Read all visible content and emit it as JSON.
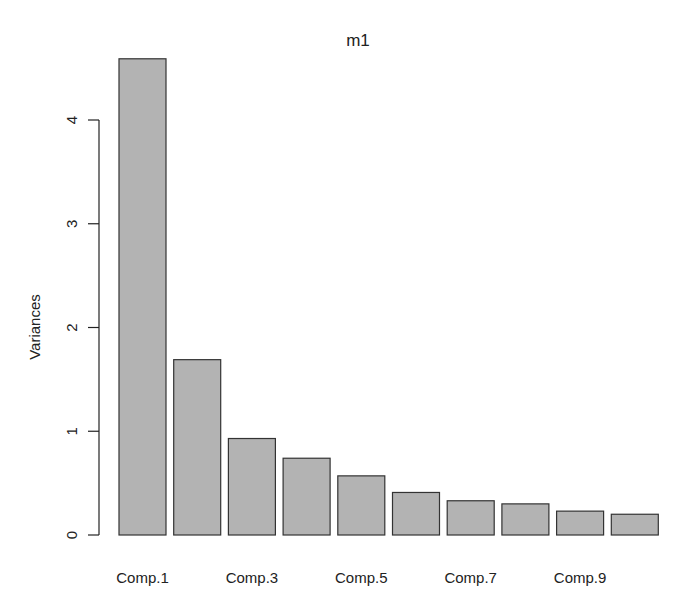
{
  "chart_data": {
    "type": "bar",
    "title": "m1",
    "xlabel": "",
    "ylabel": "Variances",
    "categories": [
      "Comp.1",
      "Comp.2",
      "Comp.3",
      "Comp.4",
      "Comp.5",
      "Comp.6",
      "Comp.7",
      "Comp.8",
      "Comp.9",
      "Comp.10"
    ],
    "values": [
      4.59,
      1.69,
      0.93,
      0.74,
      0.57,
      0.41,
      0.33,
      0.3,
      0.23,
      0.2
    ],
    "visible_xtick_labels": [
      "Comp.1",
      "Comp.3",
      "Comp.5",
      "Comp.7",
      "Comp.9"
    ],
    "yticks": [
      0,
      1,
      2,
      3,
      4
    ],
    "ylim": [
      0,
      4.6
    ],
    "grid": false,
    "legend": null,
    "bar_color": "#b3b3b3",
    "edge_color": "#333333"
  }
}
